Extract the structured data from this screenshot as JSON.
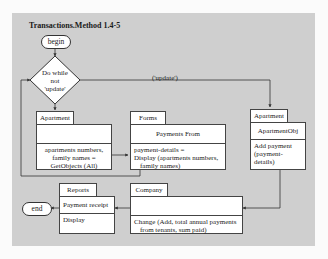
{
  "diagram": {
    "title": "Transactions.Method 1.4-5",
    "begin_label": "begin",
    "end_label": "end",
    "decision": {
      "line1": "Do while",
      "line2": "not",
      "line3": "'update'"
    },
    "branch_label": "('update')",
    "apartment_box": {
      "tab": "Apartment",
      "header": "",
      "body_line1": "apartments numbers,",
      "body_line2": "family names =",
      "body_line3": "GetObjects (All)"
    },
    "forms_box": {
      "tab": "Forms",
      "header": "Payments From",
      "body_line1": "payment-details =",
      "body_line2": "Display (apartments numbers,",
      "body_line3": "family names)"
    },
    "apartment_obj_box": {
      "tab": "Apartment",
      "header": "ApartmentObj",
      "body_line1": "Add payment",
      "body_line2": "(payment-details)"
    },
    "company_box": {
      "tab": "Company",
      "header": "",
      "body_line1": "Change (Add, total annual payments",
      "body_line2": "from tenants, sum paid)"
    },
    "reports_box": {
      "tab": "Reports",
      "header": "Payment receipt",
      "body_line1": "Display"
    },
    "colors": {
      "panel": "#cfcfcf",
      "box": "#ffffff",
      "line": "#333333"
    }
  }
}
